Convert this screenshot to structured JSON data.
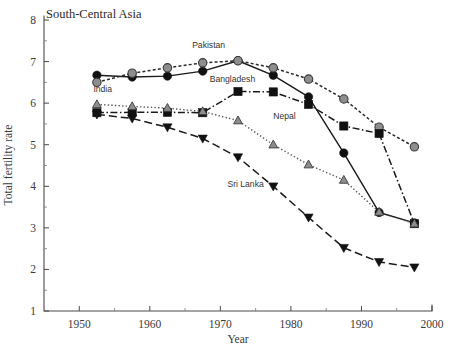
{
  "chart_data": {
    "type": "line",
    "title": "South-Central Asia",
    "xlabel": "Year",
    "ylabel": "Total fertility rate",
    "xlim": [
      1945,
      2000
    ],
    "ylim": [
      1,
      8
    ],
    "xticks": [
      1950,
      1960,
      1970,
      1980,
      1990,
      2000
    ],
    "xtick_labels": [
      "1950",
      "1960",
      "1970",
      "1980",
      "1990",
      "2000"
    ],
    "yticks": [
      1,
      2,
      3,
      4,
      5,
      6,
      7,
      8
    ],
    "ytick_labels": [
      "1",
      "2",
      "3",
      "4",
      "5",
      "6",
      "7",
      "8"
    ],
    "minor_xticks": [
      1955,
      1965,
      1975,
      1985,
      1995
    ],
    "minor_yticks": [
      1.5,
      2.5,
      3.5,
      4.5,
      5.5,
      6.5,
      7.5
    ],
    "grid": false,
    "legend": "inline-annotations",
    "x": [
      1952.5,
      1957.5,
      1962.5,
      1967.5,
      1972.5,
      1977.5,
      1982.5,
      1987.5,
      1992.5,
      1997.5
    ],
    "series": [
      {
        "name": "Bangladesh",
        "label_x": 1968.5,
        "label_y": 6.52,
        "marker": "circle-filled",
        "line_style": "solid",
        "color": "#1a1a1a",
        "values": [
          6.67,
          6.63,
          6.65,
          6.77,
          7.02,
          6.67,
          6.15,
          4.8,
          3.37,
          3.12
        ]
      },
      {
        "name": "Pakistan",
        "label_x": 1966.0,
        "label_y": 7.32,
        "marker": "circle-grey",
        "line_style": "dotted-coarse",
        "color": "#2a2a2a",
        "values": [
          6.5,
          6.72,
          6.85,
          6.97,
          7.02,
          6.85,
          6.58,
          6.1,
          5.42,
          4.95
        ]
      },
      {
        "name": "Nepal",
        "label_x": 1977.5,
        "label_y": 5.62,
        "marker": "square-filled",
        "line_style": "dash-dot",
        "color": "#1a1a1a",
        "values": [
          5.77,
          5.78,
          5.78,
          5.77,
          6.28,
          6.27,
          5.97,
          5.45,
          5.27,
          3.1
        ]
      },
      {
        "name": "India",
        "label_x": 1952.0,
        "label_y": 6.26,
        "marker": "triangle-grey",
        "line_style": "dotted-fine",
        "color": "#555555",
        "values": [
          5.97,
          5.92,
          5.88,
          5.8,
          5.58,
          5.0,
          4.52,
          4.15,
          3.38,
          3.1
        ]
      },
      {
        "name": "Sri Lanka",
        "label_x": 1971.0,
        "label_y": 3.98,
        "marker": "triangle-down-filled",
        "line_style": "dashed-long",
        "color": "#1a1a1a",
        "values": [
          5.73,
          5.63,
          5.42,
          5.15,
          4.7,
          4.0,
          3.25,
          2.52,
          2.18,
          2.05
        ]
      }
    ]
  },
  "plot_geometry": {
    "left_px": 44,
    "right_px": 432,
    "top_px": 20,
    "bottom_px": 311
  }
}
